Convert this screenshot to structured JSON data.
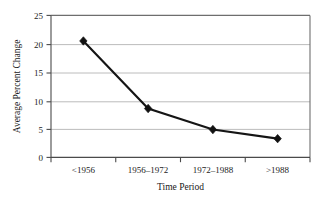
{
  "chart_data": {
    "type": "line",
    "title": "",
    "xlabel": "Time Period",
    "ylabel": "Average Percent Change",
    "categories": [
      "<1956",
      "1956–1972",
      "1972–1988",
      ">1988"
    ],
    "values": [
      20.5,
      8.6,
      4.9,
      3.3
    ],
    "series": [
      {
        "name": "Average Percent Change",
        "values": [
          20.5,
          8.6,
          4.9,
          3.3
        ]
      }
    ],
    "ylim": [
      0,
      25
    ],
    "yticks": [
      0,
      5,
      10,
      15,
      20,
      25
    ],
    "ytick_labels": [
      "0",
      "5",
      "10",
      "15",
      "20",
      "25"
    ],
    "grid": "horizontal",
    "legend": "none",
    "marker": "diamond",
    "line_color": "#151515",
    "grid_color": "#b4b4b4",
    "frame_color": "#6e6e6e",
    "background": "#ffffff"
  },
  "figure": {
    "bottom_rule_color": "#0a0a0a"
  }
}
